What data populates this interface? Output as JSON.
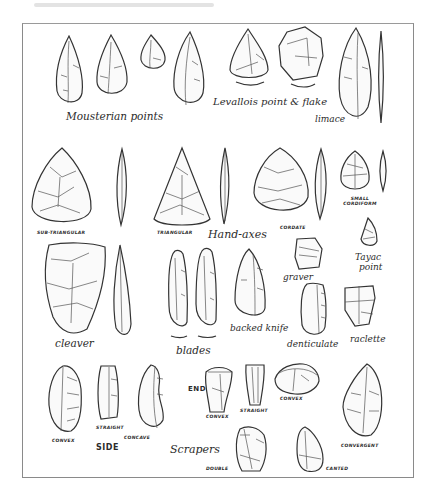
{
  "figure": {
    "groups": {
      "mousterian_points": "Mousterian points",
      "levallois": "Levallois point & flake",
      "limace": "limace",
      "sub_triangular": "SUB-TRIANGULAR",
      "triangular": "TRIANGULAR",
      "hand_axes": "Hand-axes",
      "cordate": "CORDATE",
      "small_cordiform": "SMALL CORDIFORM",
      "tayac_point_line1": "Tayac",
      "tayac_point_line2": "point",
      "graver": "graver",
      "cleaver": "cleaver",
      "blades": "blades",
      "backed_knife": "backed knife",
      "denticulate": "denticulate",
      "raclette": "raclette",
      "side": "SIDE",
      "side_convex": "CONVEX",
      "side_straight": "STRAIGHT",
      "side_concave": "CONCAVE",
      "end": "END",
      "end_convex": "CONVEX",
      "end_straight": "STRAIGHT",
      "end_convex_2": "CONVEX",
      "scrapers": "Scrapers",
      "double": "DOUBLE",
      "canted": "CANTED",
      "convergent": "CONVERGENT"
    }
  }
}
